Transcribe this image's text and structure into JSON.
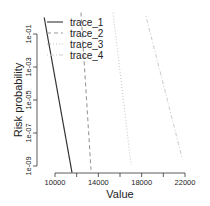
{
  "chart_data": {
    "type": "line",
    "title": "",
    "xlabel": "Value",
    "ylabel": "Risk probability",
    "xscale": "linear",
    "yscale": "log",
    "xlim": [
      9000,
      22000
    ],
    "ylim": [
      1e-10,
      1
    ],
    "x_ticks": [
      10000,
      12000,
      14000,
      16000,
      18000,
      20000,
      22000
    ],
    "x_tick_labels": [
      "10000",
      "",
      "14000",
      "",
      "18000",
      "",
      "22000"
    ],
    "y_ticks": [
      0.1,
      0.001,
      1e-05,
      1e-07,
      1e-09
    ],
    "y_tick_labels": [
      "1e-01",
      "1e-03",
      "1e-05",
      "1e-07",
      "1e-09"
    ],
    "grid": false,
    "legend_position": "top-left",
    "series": [
      {
        "name": "trace_1",
        "style": "solid",
        "color": "#333333",
        "x": [
          9000,
          11570
        ],
        "y": [
          1.0,
          4e-10
        ]
      },
      {
        "name": "trace_2",
        "style": "dashed",
        "color": "#9a9a9a",
        "x": [
          12400,
          13320
        ],
        "y": [
          2.0,
          6e-10
        ]
      },
      {
        "name": "trace_3",
        "style": "dotted",
        "color": "#c8c8c8",
        "x": [
          15350,
          17020
        ],
        "y": [
          2.0,
          1.2e-09
        ]
      },
      {
        "name": "trace_4",
        "style": "dotdash",
        "color": "#d0d0d0",
        "x": [
          18400,
          21730
        ],
        "y": [
          1.2,
          3e-09
        ]
      }
    ]
  }
}
